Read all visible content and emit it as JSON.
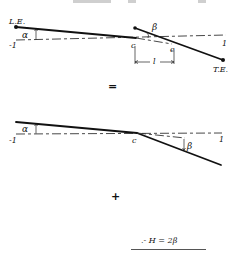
{
  "figure": {
    "top_fragment_text": "",
    "panel_1": {
      "description": "airfoil with deflected flap",
      "leading_edge_label": "L.E.",
      "trailing_edge_label": "T.E.",
      "left_axis_label": "-1",
      "right_axis_label": "1",
      "angle_of_attack_label": "α",
      "flap_angle_label": "β",
      "hinge_label": "c",
      "flap_point_label": "e",
      "flap_length_label": "l"
    },
    "equals_sign": "=",
    "panel_2": {
      "description": "equivalent bent plate",
      "left_axis_label": "-1",
      "right_axis_label": "1",
      "angle_of_attack_label": "α",
      "flap_angle_label": "β",
      "hinge_label": "c"
    },
    "plus_sign": "+",
    "panel_3": {
      "description": "partial, cut off at bottom",
      "equation_label": ".- H = 2β"
    }
  }
}
